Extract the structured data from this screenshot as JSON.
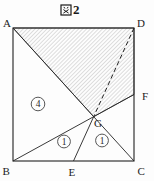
{
  "title": {
    "kanji": "図",
    "number": "2"
  },
  "square": {
    "top_left": "A",
    "top_right": "D",
    "bottom_left": "B",
    "bottom_right": "C"
  },
  "points": {
    "bottom_midpoint": "E",
    "right_midpoint": "F",
    "intersection": "G"
  },
  "regions": {
    "left_triangle": "4",
    "bottom_left_triangle": "1",
    "bottom_right_triangle": "1"
  },
  "visual": {
    "hatched_region": "A-D-F-G",
    "dashed_segment": "D-G",
    "line_color": "#222222",
    "hatch_color": "#999999"
  }
}
